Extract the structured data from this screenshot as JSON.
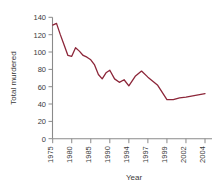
{
  "chart_data": {
    "type": "line",
    "title": "",
    "xlabel": "Year",
    "ylabel": "Total murdered",
    "ylim": [
      0,
      140
    ],
    "ytick_values": [
      0,
      20,
      40,
      60,
      80,
      100,
      120,
      140
    ],
    "ytick_labels": [
      "0",
      "20",
      "40",
      "60",
      "80",
      "100",
      "120",
      "140"
    ],
    "xtick_labels": [
      "1975",
      "1980",
      "1985",
      "1990",
      "1994",
      "1997",
      "1999",
      "2002",
      "2004"
    ],
    "xtick_years": [
      1975,
      1980,
      1985,
      1990,
      1994,
      1997,
      1999,
      2002,
      2004
    ],
    "grid": false,
    "legend": "none",
    "line_color": "#8c2639",
    "axis_color": "#8a8a8a",
    "text_color": "#3a3a3a",
    "series": [
      {
        "name": "Total murdered",
        "x": [
          1975,
          1976,
          1977,
          1978,
          1979,
          1980,
          1981,
          1982,
          1983,
          1984,
          1985,
          1986,
          1987,
          1988,
          1989,
          1990,
          1991,
          1992,
          1993,
          1994,
          1995,
          1996,
          1997,
          1998,
          1999,
          2000,
          2001,
          2002,
          2003,
          2004
        ],
        "values": [
          131,
          133,
          120,
          108,
          96,
          95,
          105,
          101,
          96,
          94,
          91,
          85,
          74,
          69,
          76,
          79,
          69,
          65,
          68,
          61,
          72,
          78,
          71,
          62,
          45,
          45,
          47,
          48,
          50,
          52
        ]
      }
    ]
  }
}
